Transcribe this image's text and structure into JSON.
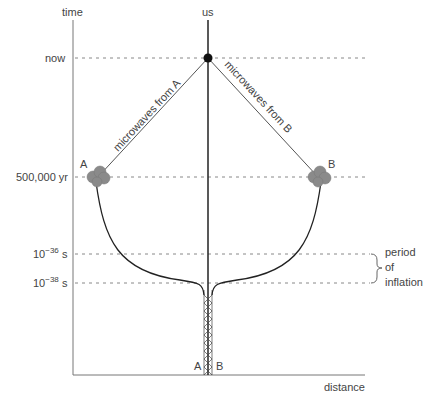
{
  "axes": {
    "y_label": "time",
    "x_label": "distance"
  },
  "observer": {
    "label": "us"
  },
  "time_marks": [
    {
      "label": "now"
    },
    {
      "label": "500,000 yr"
    },
    {
      "label_base": "10",
      "label_exp": "−36",
      "label_unit": " s"
    },
    {
      "label_base": "10",
      "label_exp": "−38",
      "label_unit": " s"
    }
  ],
  "regions": [
    {
      "label": "A"
    },
    {
      "label": "B"
    }
  ],
  "bottom_labels": {
    "left": "A",
    "right": "B"
  },
  "signals": {
    "from_a": "microwaves from A",
    "from_b": "microwaves from B"
  },
  "inflation_bracket": {
    "line1": "period",
    "line2": "of",
    "line3": "inflation"
  },
  "colors": {
    "axis": "#777777",
    "worldline": "#222222",
    "dashed": "#888888",
    "cloud": "#8a8a8a"
  }
}
